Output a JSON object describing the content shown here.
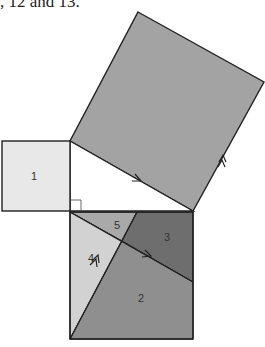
{
  "caption": ", 12 and 13.",
  "diagram": {
    "pieces": [
      {
        "id": "1",
        "label": "1",
        "color": "#e8e8e8"
      },
      {
        "id": "2",
        "label": "2",
        "color": "#8f8f8f"
      },
      {
        "id": "3",
        "label": "3",
        "color": "#6e6e6e"
      },
      {
        "id": "4",
        "label": "4",
        "color": "#d2d2d2"
      },
      {
        "id": "5",
        "label": "5",
        "color": "#a9a9a9"
      }
    ],
    "hypotenuse_square_color": "#a3a3a3",
    "triangle_color": "#ffffff",
    "stroke_color": "#222222"
  }
}
